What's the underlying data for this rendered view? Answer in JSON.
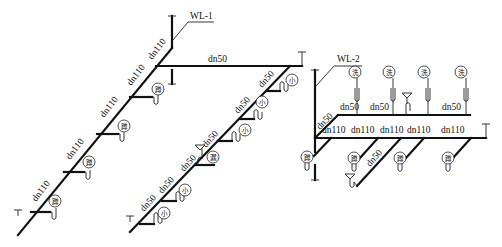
{
  "diagram": {
    "type": "isometric drainage pipe system diagram",
    "systems": [
      {
        "id": "WL-1",
        "label": "WL-1",
        "main_branch": {
          "labels": [
            "dn110",
            "dn110",
            "dn110",
            "dn110",
            "dn110"
          ],
          "fixtures": [
            "蹲",
            "蹲",
            "蹲",
            "蹲"
          ]
        },
        "horizontal": {
          "label": "dn50"
        },
        "secondary_branch": {
          "labels": [
            "dn50",
            "dn50",
            "dn50",
            "dn50",
            "dn50",
            "dn50"
          ],
          "fixtures": [
            "小",
            "小",
            "地漏",
            "小",
            "小"
          ]
        }
      },
      {
        "id": "WL-2",
        "label": "WL-2",
        "upper_branch": {
          "labels": [
            "dn50",
            "dn50",
            "dn50",
            "dn50"
          ],
          "riser_label": "dn50",
          "fixtures": [
            "洗",
            "洗",
            "洗",
            "洗"
          ]
        },
        "lower_branch": {
          "labels": [
            "dn110",
            "dn110",
            "dn110",
            "dn110",
            "dn110"
          ],
          "fixtures": [
            "蹲",
            "蹲",
            "蹲",
            "蹲"
          ],
          "diagonal_label": "dn50"
        }
      }
    ],
    "fixture_glyphs": {
      "squat_toilet": "蹲",
      "urinal": "小",
      "floor_drain": "漏",
      "washbasin": "洗"
    },
    "labels": {
      "wl1": "WL-1",
      "wl2": "WL-2",
      "dn110": "dn110",
      "dn50": "dn50",
      "squat": "蹲",
      "urinal": "小",
      "drain": "漏",
      "wash": "洗"
    }
  }
}
